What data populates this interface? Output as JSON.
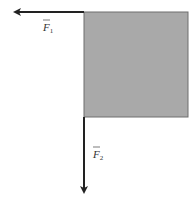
{
  "diagram": {
    "block": {
      "fill": "#a9a9a9",
      "stroke": "#6e6e6e"
    },
    "forces": [
      {
        "id": "F1",
        "symbol": "F",
        "subscript": "1",
        "direction": "left",
        "color": "#222222"
      },
      {
        "id": "F2",
        "symbol": "F",
        "subscript": "2",
        "direction": "down",
        "color": "#222222"
      }
    ]
  }
}
